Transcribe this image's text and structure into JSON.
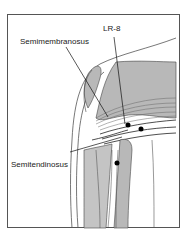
{
  "figure": {
    "labels": {
      "semimembranosus": "Semimembranosus",
      "lr8": "LR-8",
      "semitendinosus": "Semitendinosus"
    },
    "colors": {
      "muscle_fill": "#b8b8b8",
      "muscle_light": "#d8d8d8",
      "outline": "#333333",
      "point": "#000000"
    }
  }
}
